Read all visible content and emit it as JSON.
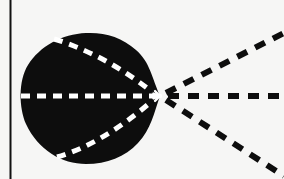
{
  "figure": {
    "width": 284,
    "height": 179,
    "background_color": "#f6f6f5",
    "ink_color": "#0d0d0d",
    "highlight_color": "#ffffff"
  },
  "border_rule": {
    "name": "left vertical rule",
    "x": 10.5,
    "y_top": 0,
    "y_bottom": 179,
    "stroke_width": 2.0,
    "color": "#111111"
  },
  "blob": {
    "name": "solid black lobe",
    "fill": "#0d0d0d",
    "center_x": 86,
    "center_y": 98,
    "radius_x": 66,
    "radius_y": 65,
    "left_edge_x": 21,
    "right_vertex_x": 160,
    "top_edge_y": 33,
    "bottom_edge_y": 164,
    "path": "M 160 96 C 152 78 150 62 136 50 C 122 37 104 32 86 33 C 62 34 40 46 28 65 C 18 81 19 108 26 124 C 38 150 62 164 86 164 C 107 164 125 157 138 143 C 151 129 154 113 160 96 Z",
    "notch_upper": {
      "x": 52,
      "y": 38
    },
    "notch_lower": {
      "x": 56,
      "y": 158
    }
  },
  "vertex": {
    "name": "convergence point",
    "x": 160,
    "y": 96,
    "starburst_radius": 7,
    "color": "#ffffff"
  },
  "white_dashes": {
    "dash_pattern": "9 7",
    "stroke_width": 5,
    "color": "#ffffff",
    "curves": [
      {
        "label": "upper inner curve",
        "path": "M 54 39 C 84 48 120 66 152 92"
      },
      {
        "label": "axis line",
        "path": "M 21 96 L 155 96"
      },
      {
        "label": "lower inner curve",
        "path": "M 57 157 C 86 149 120 129 152 101"
      }
    ]
  },
  "black_rays": {
    "dash_pattern": "11 9",
    "stroke_width": 6,
    "color": "#0d0d0d",
    "origin_x": 160,
    "origin_y": 96,
    "rays": [
      {
        "label": "upper ray",
        "x1": 166,
        "y1": 93,
        "x2": 284,
        "y2": 33,
        "angle_deg": 27
      },
      {
        "label": "horizontal ray",
        "x1": 168,
        "y1": 96,
        "x2": 284,
        "y2": 96,
        "angle_deg": 0
      },
      {
        "label": "lower ray",
        "x1": 166,
        "y1": 100,
        "x2": 284,
        "y2": 176,
        "angle_deg": -33
      }
    ]
  },
  "labels": {
    "caption": ""
  }
}
